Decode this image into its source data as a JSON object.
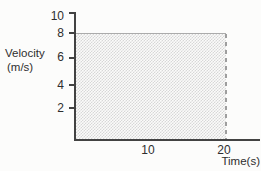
{
  "figure": {
    "background": "#fcfcfb"
  },
  "chart_data": {
    "type": "area",
    "title": "",
    "xlabel": "Time(s)",
    "ylabel": "Velocity (m/s)",
    "ylabel_lines": [
      "Velocity",
      "(m/s)"
    ],
    "x": [
      0,
      20
    ],
    "series": [
      {
        "name": "Velocity",
        "values": [
          8,
          8
        ]
      }
    ],
    "xlim": [
      0,
      22
    ],
    "ylim": [
      0,
      10
    ],
    "xticks": [
      10,
      20
    ],
    "yticks": [
      10,
      8,
      6,
      4,
      2
    ],
    "grid": false,
    "legend": "none",
    "shaded_region": {
      "x_start": 0,
      "x_end": 20,
      "y_start": 0,
      "y_end": 8,
      "fill": "stipple-dot-pattern",
      "right_edge": "dashed"
    },
    "colors": {
      "axis": "#424242",
      "text": "#2e2e2e",
      "shade_dot": "#d7d7d7",
      "shade_top_line": "#ababab",
      "dashed_line": "#9e9e9e"
    }
  }
}
